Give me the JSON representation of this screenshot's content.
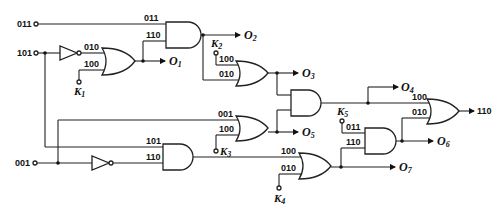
{
  "diagram": {
    "type": "logic-circuit",
    "inputs": [
      {
        "id": "in-011",
        "label": "011"
      },
      {
        "id": "in-101",
        "label": "101"
      },
      {
        "id": "in-001",
        "label": "001"
      }
    ],
    "keys": [
      {
        "id": "K1",
        "label": "K",
        "sub": "1"
      },
      {
        "id": "K2",
        "label": "K",
        "sub": "2"
      },
      {
        "id": "K3",
        "label": "K",
        "sub": "3"
      },
      {
        "id": "K4",
        "label": "K",
        "sub": "4"
      },
      {
        "id": "K5",
        "label": "K",
        "sub": "5"
      }
    ],
    "outputs": [
      {
        "id": "O1",
        "label": "O",
        "sub": "1"
      },
      {
        "id": "O2",
        "label": "O",
        "sub": "2"
      },
      {
        "id": "O3",
        "label": "O",
        "sub": "3"
      },
      {
        "id": "O4",
        "label": "O",
        "sub": "4"
      },
      {
        "id": "O5",
        "label": "O",
        "sub": "5"
      },
      {
        "id": "O6",
        "label": "O",
        "sub": "6"
      },
      {
        "id": "O7",
        "label": "O",
        "sub": "7"
      }
    ],
    "final_output": "110",
    "wire_labels": {
      "and1_a": "011",
      "and1_b": "110",
      "or1_a": "010",
      "or1_b": "100",
      "or2_a": "100",
      "or2_b": "010",
      "or3_a": "001",
      "or3_b": "100",
      "and4_a": "101",
      "and4_b": "110",
      "or4_a": "100",
      "or4_b": "010",
      "and5_a": "011",
      "and5_b": "110",
      "or5_a": "100",
      "or5_b": "010"
    }
  }
}
